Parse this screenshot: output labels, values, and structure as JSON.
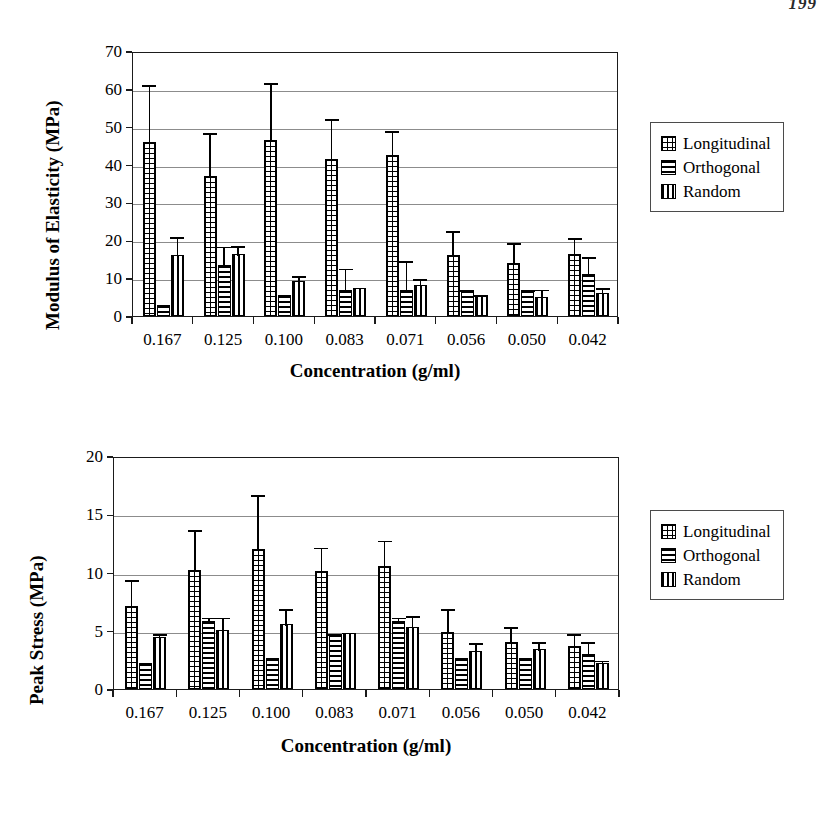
{
  "page": {
    "number": "199"
  },
  "figures": [
    {
      "id": "modulus-of-elasticity",
      "ylabel": "Modulus of Elasticity (MPa)",
      "xlabel": "Concentration (g/ml)",
      "yticks": [
        "0",
        "10",
        "20",
        "30",
        "40",
        "50",
        "60",
        "70"
      ],
      "xticks": [
        "0.167",
        "0.125",
        "0.100",
        "0.083",
        "0.071",
        "0.056",
        "0.050",
        "0.042"
      ],
      "legend": [
        {
          "label": "Longitudinal",
          "pattern": "grid"
        },
        {
          "label": "Orthogonal",
          "pattern": "horizontal-lines"
        },
        {
          "label": "Random",
          "pattern": "vertical-lines"
        }
      ]
    },
    {
      "id": "peak-stress",
      "ylabel": "Peak Stress (MPa)",
      "xlabel": "Concentration (g/ml)",
      "yticks": [
        "0",
        "5",
        "10",
        "15",
        "20"
      ],
      "xticks": [
        "0.167",
        "0.125",
        "0.100",
        "0.083",
        "0.071",
        "0.056",
        "0.050",
        "0.042"
      ],
      "legend": [
        {
          "label": "Longitudinal",
          "pattern": "grid"
        },
        {
          "label": "Orthogonal",
          "pattern": "horizontal-lines"
        },
        {
          "label": "Random",
          "pattern": "vertical-lines"
        }
      ]
    }
  ],
  "chart_data": [
    {
      "type": "bar",
      "title": "",
      "xlabel": "Concentration (g/ml)",
      "ylabel": "Modulus of Elasticity (MPa)",
      "ylim": [
        0,
        70
      ],
      "ytick_step": 10,
      "grid": true,
      "legend_position": "right-outside",
      "categories": [
        "0.167",
        "0.125",
        "0.100",
        "0.083",
        "0.071",
        "0.056",
        "0.050",
        "0.042"
      ],
      "series": [
        {
          "name": "Longitudinal",
          "pattern": "grid",
          "values": [
            46.0,
            37.0,
            46.5,
            41.5,
            42.5,
            16.0,
            14.0,
            16.3
          ],
          "errors_upper": [
            15.5,
            11.8,
            15.5,
            11.0,
            6.8,
            7.0,
            5.8,
            4.8
          ]
        },
        {
          "name": "Orthogonal",
          "pattern": "horizontal-lines",
          "values": [
            3.0,
            13.5,
            5.5,
            7.0,
            7.0,
            7.0,
            7.0,
            11.0
          ],
          "errors_upper": [
            0.0,
            5.3,
            0.0,
            6.0,
            8.0,
            0.3,
            0.3,
            5.0
          ]
        },
        {
          "name": "Random",
          "pattern": "vertical-lines",
          "values": [
            16.0,
            16.3,
            9.3,
            7.5,
            8.3,
            5.5,
            5.0,
            6.0
          ],
          "errors_upper": [
            5.3,
            2.7,
            1.7,
            0.0,
            2.0,
            0.5,
            2.5,
            1.8
          ]
        }
      ]
    },
    {
      "type": "bar",
      "title": "",
      "xlabel": "Concentration (g/ml)",
      "ylabel": "Peak Stress (MPa)",
      "ylim": [
        0,
        20
      ],
      "ytick_step": 5,
      "grid": true,
      "legend_position": "right-outside",
      "categories": [
        "0.167",
        "0.125",
        "0.100",
        "0.083",
        "0.071",
        "0.056",
        "0.050",
        "0.042"
      ],
      "series": [
        {
          "name": "Longitudinal",
          "pattern": "grid",
          "values": [
            7.1,
            10.2,
            12.0,
            10.1,
            10.6,
            4.9,
            4.0,
            3.7
          ],
          "errors_upper": [
            2.4,
            3.6,
            4.8,
            2.2,
            2.3,
            2.1,
            1.5,
            1.2
          ]
        },
        {
          "name": "Orthogonal",
          "pattern": "horizontal-lines",
          "values": [
            2.2,
            5.8,
            2.7,
            4.7,
            5.8,
            2.7,
            2.7,
            3.0
          ],
          "errors_upper": [
            0.0,
            0.5,
            0.0,
            0.2,
            0.5,
            0.0,
            0.0,
            1.2
          ]
        },
        {
          "name": "Random",
          "pattern": "vertical-lines",
          "values": [
            4.5,
            5.1,
            5.6,
            4.8,
            5.3,
            3.3,
            3.4,
            2.2
          ],
          "errors_upper": [
            0.4,
            1.2,
            1.4,
            0.2,
            1.1,
            0.8,
            0.8,
            0.4
          ]
        }
      ]
    }
  ]
}
